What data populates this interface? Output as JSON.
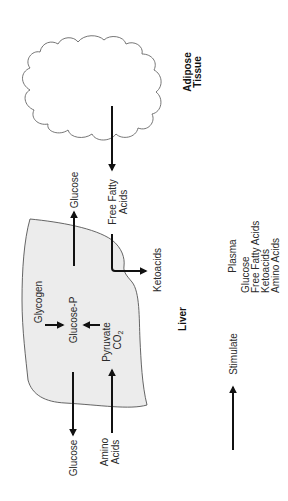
{
  "diagram": {
    "orientation": "rotated-90-ccw",
    "colors": {
      "background": "#ffffff",
      "liver_fill": "#ececec",
      "outline": "#555555",
      "arrow": "#111111",
      "text": "#2a2a2a"
    },
    "adipose": {
      "label_line1": "Adipose",
      "label_line2": "Tissue"
    },
    "liver": {
      "label": "Liver",
      "internal": {
        "glycogen": "Glycogen",
        "glucose_p": "Glucose-P",
        "pyruvate": "Pyruvate",
        "co2": "CO",
        "co2_sub": "2"
      }
    },
    "flows": {
      "glucose_out_right": "Glucose",
      "free_fatty_acids_line1": "Free Fatty",
      "free_fatty_acids_line2": "Acids",
      "ketoacids": "Ketoacids",
      "glucose_out_left": "Glucose",
      "amino_acids_line1": "Amino",
      "amino_acids_line2": "Acids"
    },
    "legend": {
      "stimulate": "Stimulate",
      "plasma_title": "Plasma",
      "plasma_items": [
        "Glucose",
        "Free Fatty Acids",
        "Ketoacids",
        "Amino Acids"
      ]
    }
  }
}
